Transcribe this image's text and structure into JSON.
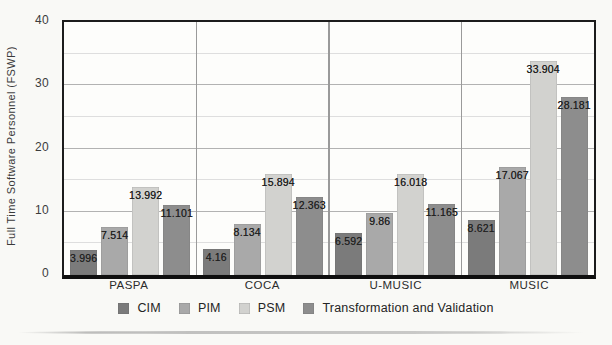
{
  "figure": {
    "background": "#f9f9f6",
    "border_color": "#1c1c1c"
  },
  "chart_data": {
    "type": "bar",
    "title": "",
    "xlabel": "",
    "ylabel": "Full Time Software Personnel  (FSWP)",
    "ylim": [
      0,
      40
    ],
    "yticks": [
      0,
      10,
      20,
      30,
      40
    ],
    "grid": "horizontal",
    "grid_step": 5,
    "legend_position": "bottom",
    "categories": [
      "PASPA",
      "COCA",
      "U-MUSIC",
      "MUSIC"
    ],
    "series": [
      {
        "name": "CIM",
        "color": "#7b7b7b",
        "values": [
          3.996,
          4.16,
          6.592,
          8.621
        ]
      },
      {
        "name": "PIM",
        "color": "#a9a9a9",
        "values": [
          7.514,
          8.134,
          9.86,
          17.067
        ]
      },
      {
        "name": "PSM",
        "color": "#d2d2cf",
        "values": [
          13.992,
          15.894,
          16.018,
          33.904
        ]
      },
      {
        "name": "Transformation and Validation",
        "color": "#8d8d8d",
        "values": [
          11.101,
          12.363,
          11.165,
          28.181
        ]
      }
    ]
  }
}
